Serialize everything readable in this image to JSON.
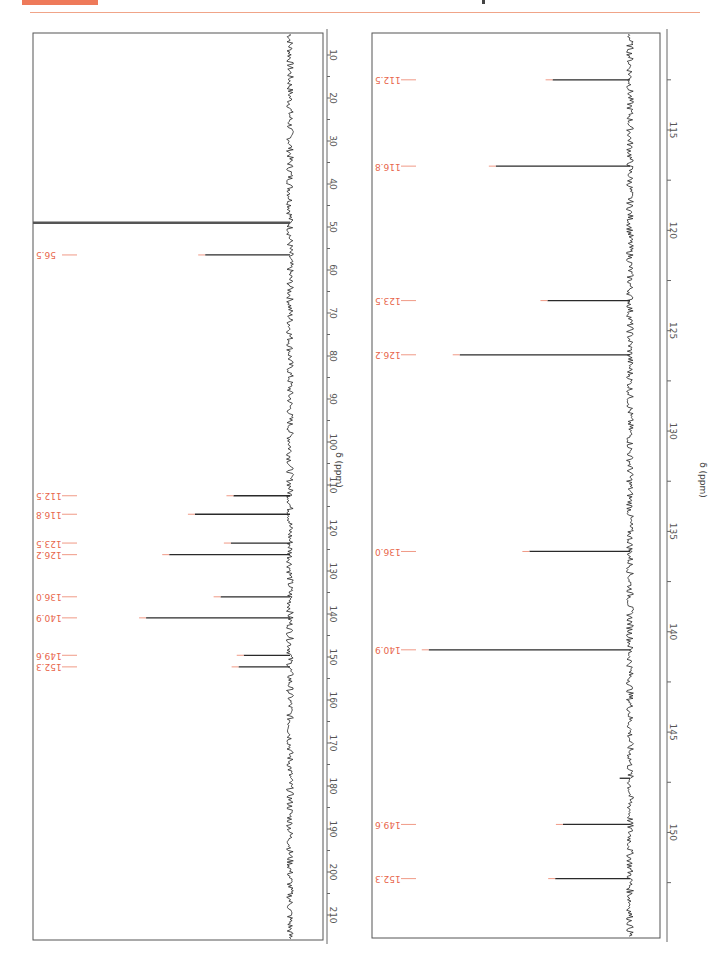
{
  "header": {
    "accent_color": "#ee7a5a",
    "rule_color": "#f0a488"
  },
  "colors": {
    "peak_label": "#e8664c",
    "peak_line": "#2a2a2a",
    "axis": "#666666"
  },
  "chart_data": [
    {
      "type": "line",
      "title": "13C NMR spectrum (full range)",
      "orientation": "rotated 90 degrees, shift axis vertical",
      "xlabel": "δ (ppm)",
      "ylabel": "",
      "xlim": [
        5,
        215
      ],
      "ticks": [
        10,
        20,
        30,
        40,
        50,
        60,
        70,
        80,
        90,
        100,
        110,
        120,
        130,
        140,
        150,
        160,
        170,
        180,
        190,
        200,
        210
      ],
      "tick_labels": [
        "10",
        "20",
        "30",
        "40",
        "50",
        "60",
        "70",
        "80",
        "90",
        "100",
        "110",
        "120",
        "130",
        "140",
        "150",
        "160",
        "170",
        "180",
        "190",
        "200",
        "210"
      ],
      "solvent_peak_ppm": 49.0,
      "peaks": [
        {
          "ppm": 56.5,
          "label": "56.5",
          "rel_intensity": 0.33
        },
        {
          "ppm": 112.5,
          "label": "112.5",
          "rel_intensity": 0.22
        },
        {
          "ppm": 116.8,
          "label": "116.8",
          "rel_intensity": 0.37
        },
        {
          "ppm": 123.5,
          "label": "123.5",
          "rel_intensity": 0.23
        },
        {
          "ppm": 126.2,
          "label": "126.2",
          "rel_intensity": 0.47
        },
        {
          "ppm": 136.0,
          "label": "136.0",
          "rel_intensity": 0.27
        },
        {
          "ppm": 140.9,
          "label": "140.9",
          "rel_intensity": 0.56
        },
        {
          "ppm": 149.6,
          "label": "149.6",
          "rel_intensity": 0.18
        },
        {
          "ppm": 152.3,
          "label": "152.3",
          "rel_intensity": 0.2
        }
      ]
    },
    {
      "type": "line",
      "title": "13C NMR spectrum (aromatic region expansion)",
      "orientation": "rotated 90 degrees, shift axis vertical",
      "xlabel": "δ (ppm)",
      "ylabel": "",
      "xlim": [
        110.2,
        155.3
      ],
      "ticks": [
        115,
        120,
        125,
        130,
        135,
        140,
        145,
        150
      ],
      "tick_labels": [
        "115",
        "120",
        "125",
        "130",
        "135",
        "140",
        "145",
        "150"
      ],
      "minor_ticks": [
        112.5,
        117.5,
        122.5,
        127.5,
        132.5,
        137.5,
        142.5,
        147.5,
        152.5
      ],
      "peaks": [
        {
          "ppm": 112.5,
          "label": "112.5",
          "rel_intensity": 0.3
        },
        {
          "ppm": 116.8,
          "label": "116.8",
          "rel_intensity": 0.52
        },
        {
          "ppm": 123.5,
          "label": "123.5",
          "rel_intensity": 0.32
        },
        {
          "ppm": 126.2,
          "label": "126.2",
          "rel_intensity": 0.66
        },
        {
          "ppm": 136.0,
          "label": "136.0",
          "rel_intensity": 0.39
        },
        {
          "ppm": 140.9,
          "label": "140.9",
          "rel_intensity": 0.78
        },
        {
          "ppm": 149.6,
          "label": "149.6",
          "rel_intensity": 0.26
        },
        {
          "ppm": 152.3,
          "label": "152.3",
          "rel_intensity": 0.29
        }
      ],
      "artifacts": [
        {
          "ppm": 147.3,
          "rel_intensity": 0.04
        }
      ]
    }
  ]
}
